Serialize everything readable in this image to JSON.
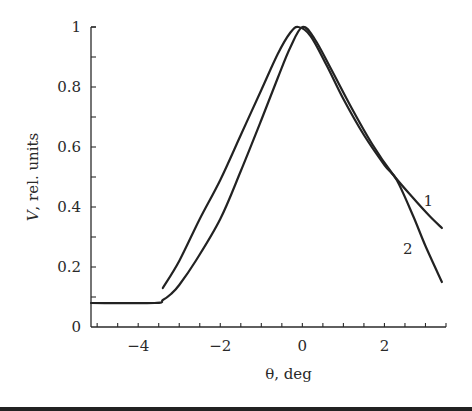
{
  "chart_data": {
    "type": "line",
    "title": "",
    "xlabel": "θ, deg",
    "ylabel": "V, rel. units",
    "xlim": [
      -5.15,
      3.5
    ],
    "ylim": [
      0,
      1
    ],
    "grid": false,
    "legend": "inline curve labels",
    "x_ticks": [
      -4,
      -2,
      0,
      2
    ],
    "x_tick_labels": [
      "−4",
      "−2",
      "0",
      "2"
    ],
    "x_minor_step": 0.5,
    "y_ticks": [
      0,
      0.2,
      0.4,
      0.6,
      0.8,
      1
    ],
    "y_tick_labels": [
      "0",
      "0.2",
      "0.4",
      "0.6",
      "0.8",
      "1"
    ],
    "y_minor_step": 0.1,
    "series": [
      {
        "name": "1",
        "label_pos": [
          2.95,
          0.42
        ],
        "points": [
          [
            -5.15,
            0.08
          ],
          [
            -3.6,
            0.08
          ],
          [
            -3.4,
            0.09
          ],
          [
            -3.2,
            0.11
          ],
          [
            -3.0,
            0.14
          ],
          [
            -2.6,
            0.22
          ],
          [
            -2.0,
            0.36
          ],
          [
            -1.5,
            0.52
          ],
          [
            -1.0,
            0.69
          ],
          [
            -0.6,
            0.83
          ],
          [
            -0.3,
            0.93
          ],
          [
            0.0,
            1.0
          ],
          [
            0.3,
            0.96
          ],
          [
            0.7,
            0.86
          ],
          [
            1.2,
            0.73
          ],
          [
            1.7,
            0.61
          ],
          [
            2.2,
            0.51
          ],
          [
            2.7,
            0.43
          ],
          [
            3.1,
            0.37
          ],
          [
            3.4,
            0.33
          ]
        ]
      },
      {
        "name": "2",
        "label_pos": [
          2.45,
          0.26
        ],
        "points": [
          [
            -3.4,
            0.13
          ],
          [
            -3.0,
            0.22
          ],
          [
            -2.5,
            0.36
          ],
          [
            -2.0,
            0.49
          ],
          [
            -1.5,
            0.64
          ],
          [
            -1.0,
            0.79
          ],
          [
            -0.6,
            0.91
          ],
          [
            -0.3,
            0.98
          ],
          [
            -0.1,
            1.0
          ],
          [
            0.2,
            0.97
          ],
          [
            0.6,
            0.87
          ],
          [
            1.0,
            0.76
          ],
          [
            1.5,
            0.64
          ],
          [
            2.0,
            0.54
          ],
          [
            2.3,
            0.49
          ],
          [
            2.7,
            0.37
          ],
          [
            3.0,
            0.27
          ],
          [
            3.4,
            0.15
          ]
        ]
      }
    ]
  }
}
